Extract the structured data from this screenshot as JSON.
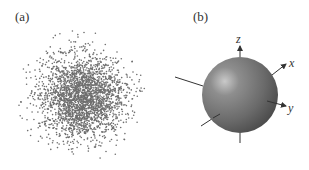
{
  "panels": [
    {
      "label": "(a)",
      "description": "scatter cloud of points, dense gaussian-like cluster"
    },
    {
      "label": "(b)",
      "description": "shaded sphere with coordinate axes"
    }
  ],
  "axes": {
    "x": "x",
    "y": "y",
    "z": "z"
  },
  "colors": {
    "dots": "#6e6e6e",
    "sphere_dark": "#4a4a4a",
    "sphere_mid": "#777777",
    "sphere_highlight": "#c8c8c8",
    "axis": "#333333"
  }
}
